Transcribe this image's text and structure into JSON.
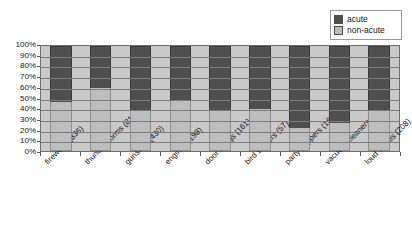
{
  "chart_data": {
    "type": "bar",
    "subtype": "stacked-100-percent",
    "title": "",
    "xlabel": "",
    "ylabel": "",
    "ylim": [
      0,
      100
    ],
    "grid": true,
    "legend_position": "top-right",
    "categories": [
      "fireworks(836)",
      "thunderstorms (817)",
      "gunshots(430)",
      "engines (198)",
      "door bangs (161)",
      "bird scarers (57)",
      "party poppers (160)",
      "vacuum cleaners(343)",
      "loud voices (208)"
    ],
    "y_tick_labels": [
      "100%",
      "90%",
      "80%",
      "70%",
      "60%",
      "50%",
      "40%",
      "30%",
      "20%",
      "10%",
      "0%"
    ],
    "y_tick_values": [
      100,
      90,
      80,
      70,
      60,
      50,
      40,
      30,
      20,
      10,
      0
    ],
    "series": [
      {
        "name": "acute",
        "color": "#4f4f4f",
        "values": [
          53,
          40,
          62,
          52,
          61,
          60,
          78,
          73,
          62
        ]
      },
      {
        "name": "non-acute",
        "color": "#bdbdbd",
        "values": [
          47,
          60,
          38,
          48,
          39,
          40,
          22,
          27,
          38
        ]
      }
    ]
  },
  "legend": {
    "items": [
      {
        "label": "acute",
        "color": "#4f4f4f"
      },
      {
        "label": "non-acute",
        "color": "#bdbdbd"
      }
    ]
  }
}
